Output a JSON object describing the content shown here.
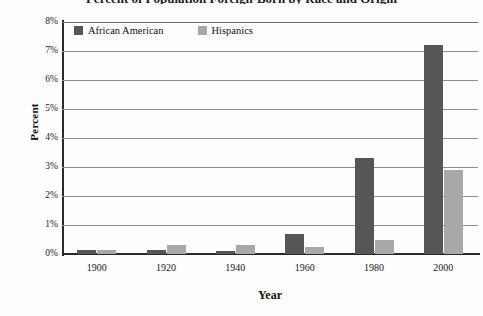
{
  "chart_data": {
    "type": "bar",
    "title": "Percent of Population Foreign-Born by Race and Origin",
    "xlabel": "Year",
    "ylabel": "Percent",
    "categories": [
      "1900",
      "1920",
      "1940",
      "1960",
      "1980",
      "2000"
    ],
    "series": [
      {
        "name": "African American",
        "color": "#565656",
        "values": [
          0.15,
          0.15,
          0.1,
          0.7,
          3.3,
          7.2
        ]
      },
      {
        "name": "Hispanics",
        "color": "#a8a8a8",
        "values": [
          0.15,
          0.3,
          0.3,
          0.25,
          0.5,
          2.9
        ]
      }
    ],
    "ylim": [
      0,
      8
    ],
    "ytick_labels": [
      "8%",
      "7%",
      "6%",
      "5%",
      "4%",
      "3%",
      "2%",
      "1%",
      "0%"
    ],
    "ytick_values": [
      8,
      7,
      6,
      5,
      4,
      3,
      2,
      1,
      0
    ],
    "grid": true,
    "legend_position": "top-left-inside"
  },
  "legend": {
    "items": [
      {
        "label": "African American"
      },
      {
        "label": "Hispanics"
      }
    ]
  }
}
